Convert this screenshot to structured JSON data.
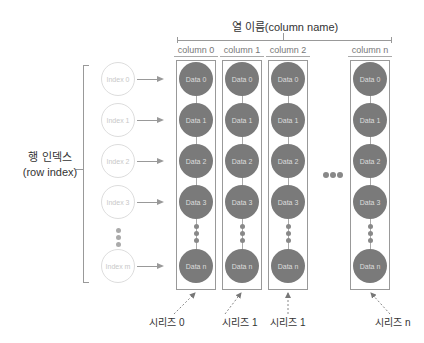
{
  "title": "열 이름(column name)",
  "row_index_label": [
    "행 인덱스",
    "(row index)"
  ],
  "columns": [
    {
      "header": "column 0",
      "cells": [
        "Data 0",
        "Data 1",
        "Data 2",
        "Data 3",
        "Data n"
      ],
      "series": "시리즈 0"
    },
    {
      "header": "column 1",
      "cells": [
        "Data 0",
        "Data 1",
        "Data 2",
        "Data 3",
        "Data n"
      ],
      "series": "시리즈 1"
    },
    {
      "header": "column 2",
      "cells": [
        "Data 0",
        "Data 1",
        "Data 2",
        "Data 3",
        "Data n"
      ],
      "series": "시리즈 1"
    },
    {
      "header": "column n",
      "cells": [
        "Data 0",
        "Data 1",
        "Data 2",
        "Data 3",
        "Data n"
      ],
      "series": "시리즈 n"
    }
  ],
  "indexes": [
    "Index 0",
    "Index 1",
    "Index 2",
    "Index 3",
    "Index m"
  ],
  "colors": {
    "data_circle": "#7a7a7a",
    "index_circle_border": "#dddddd",
    "line": "#999999"
  }
}
